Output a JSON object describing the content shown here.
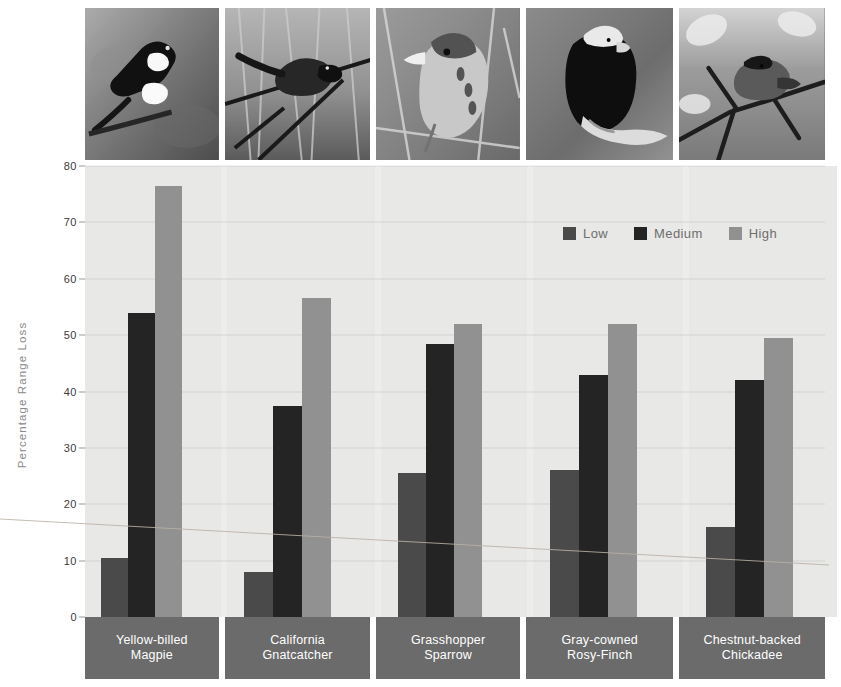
{
  "chart_data": {
    "type": "bar",
    "title": "",
    "xlabel": "",
    "ylabel": "Percentage Range Loss",
    "ylim": [
      0,
      80
    ],
    "yticks": [
      0,
      10,
      20,
      30,
      40,
      50,
      60,
      70,
      80
    ],
    "grid": true,
    "legend_position": "upper right",
    "categories": [
      "Yellow-billed Magpie",
      "California Gnatcatcher",
      "Grasshopper Sparrow",
      "Gray-cowned Rosy-Finch",
      "Chestnut-backed Chickadee"
    ],
    "category_lines": [
      [
        "Yellow-billed",
        "Magpie"
      ],
      [
        "California",
        "Gnatcatcher"
      ],
      [
        "Grasshopper",
        "Sparrow"
      ],
      [
        "Gray-cowned",
        "Rosy-Finch"
      ],
      [
        "Chestnut-backed",
        "Chickadee"
      ]
    ],
    "series": [
      {
        "name": "Low",
        "color": "#4a4a4a",
        "values": [
          10.5,
          8.0,
          25.5,
          26.0,
          16.0
        ]
      },
      {
        "name": "Medium",
        "color": "#242424",
        "values": [
          54.0,
          37.5,
          48.5,
          43.0,
          42.0
        ]
      },
      {
        "name": "High",
        "color": "#919191",
        "values": [
          76.5,
          56.5,
          52.0,
          52.0,
          49.5
        ]
      }
    ]
  },
  "axis": {
    "y_label": "Percentage Range Loss",
    "y_ticks": [
      "0",
      "10",
      "20",
      "30",
      "40",
      "50",
      "60",
      "70",
      "80"
    ]
  },
  "legend": {
    "items": [
      {
        "label": "Low",
        "swatch": "#4a4a4a"
      },
      {
        "label": "Medium",
        "swatch": "#242424"
      },
      {
        "label": "High",
        "swatch": "#919191"
      }
    ]
  },
  "photos": [
    {
      "caption": "Yellow-billed Magpie photo",
      "alt": "magpie-photo"
    },
    {
      "caption": "California Gnatcatcher photo",
      "alt": "gnatcatcher-photo"
    },
    {
      "caption": "Grasshopper Sparrow photo",
      "alt": "sparrow-photo"
    },
    {
      "caption": "Gray-cowned Rosy-Finch photo",
      "alt": "rosy-finch-photo"
    },
    {
      "caption": "Chestnut-backed Chickadee photo",
      "alt": "chickadee-photo"
    }
  ],
  "colors": {
    "plot_background": "#ededeb",
    "label_band": "#6b6b6b",
    "low": "#4a4a4a",
    "medium": "#242424",
    "high": "#919191"
  }
}
